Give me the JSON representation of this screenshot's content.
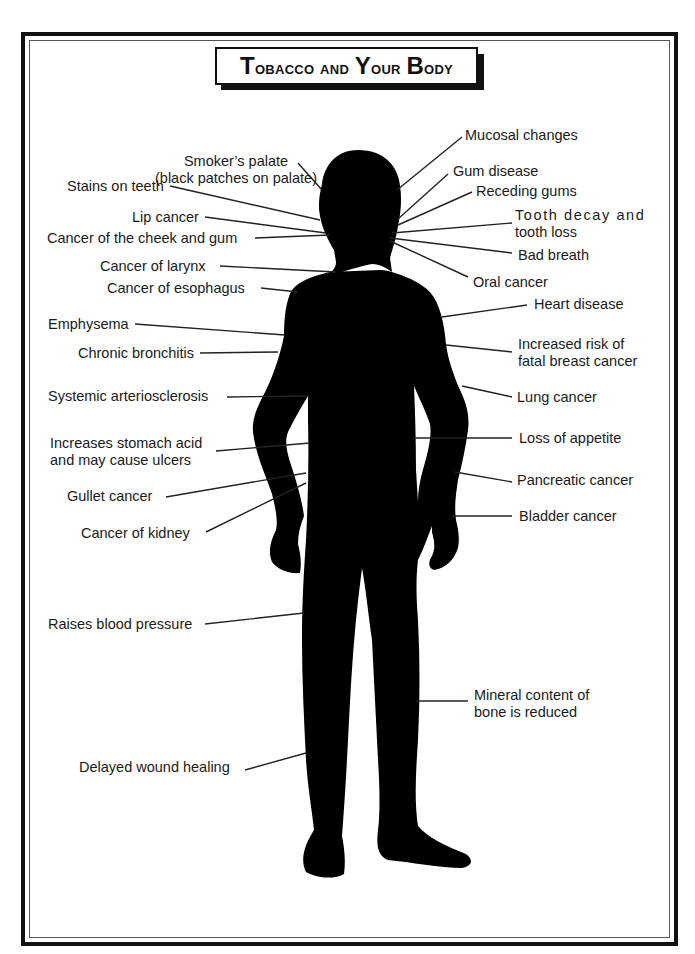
{
  "title": {
    "text": "Tobacco and Your Body",
    "display_parts": [
      {
        "cap": "T",
        "rest": "obacco and "
      },
      {
        "cap": "Y",
        "rest": "our "
      },
      {
        "cap": "B",
        "rest": "ody"
      }
    ]
  },
  "colors": {
    "silhouette": "#000000",
    "border": "#111111",
    "text": "#1a1a1a",
    "background": "#ffffff"
  },
  "labels_left": [
    {
      "id": "smokers-palate",
      "line1": "Smoker’s palate",
      "line2": "(black patches on palate)"
    },
    {
      "id": "stains-on-teeth",
      "line1": "Stains on teeth"
    },
    {
      "id": "lip-cancer",
      "line1": "Lip cancer"
    },
    {
      "id": "cancer-cheek-gum",
      "line1": "Cancer of the cheek and gum"
    },
    {
      "id": "cancer-larynx",
      "line1": "Cancer of larynx"
    },
    {
      "id": "cancer-esophagus",
      "line1": "Cancer of esophagus"
    },
    {
      "id": "emphysema",
      "line1": "Emphysema"
    },
    {
      "id": "chronic-bronchitis",
      "line1": "Chronic bronchitis"
    },
    {
      "id": "systemic-arteriosclerosis",
      "line1": "Systemic arteriosclerosis"
    },
    {
      "id": "stomach-acid",
      "line1": "Increases stomach acid",
      "line2": "and may cause ulcers"
    },
    {
      "id": "gullet-cancer",
      "line1": "Gullet cancer"
    },
    {
      "id": "cancer-kidney",
      "line1": "Cancer of kidney"
    },
    {
      "id": "blood-pressure",
      "line1": "Raises blood pressure"
    },
    {
      "id": "wound-healing",
      "line1": "Delayed wound healing"
    }
  ],
  "labels_right": [
    {
      "id": "mucosal-changes",
      "line1": "Mucosal changes"
    },
    {
      "id": "gum-disease",
      "line1": "Gum disease"
    },
    {
      "id": "receding-gums",
      "line1": "Receding  gums"
    },
    {
      "id": "tooth-decay",
      "line1": "Tooth decay and",
      "line2": "tooth loss"
    },
    {
      "id": "bad-breath",
      "line1": "Bad breath"
    },
    {
      "id": "oral-cancer",
      "line1": "Oral cancer"
    },
    {
      "id": "heart-disease",
      "line1": "Heart disease"
    },
    {
      "id": "breast-cancer",
      "line1": "Increased risk of",
      "line2": "fatal breast cancer"
    },
    {
      "id": "lung-cancer",
      "line1": "Lung cancer"
    },
    {
      "id": "loss-appetite",
      "line1": "Loss of appetite"
    },
    {
      "id": "pancreatic-cancer",
      "line1": "Pancreatic cancer"
    },
    {
      "id": "bladder-cancer",
      "line1": "Bladder cancer"
    },
    {
      "id": "bone-mineral",
      "line1": "Mineral content of",
      "line2": "bone is reduced"
    }
  ]
}
